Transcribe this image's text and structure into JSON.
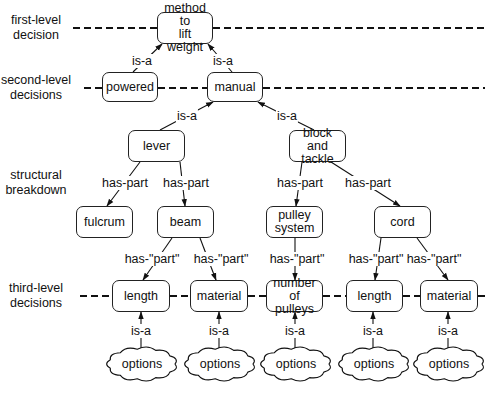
{
  "diagram": {
    "type": "decision hierarchy / part-whole tree",
    "side_labels": [
      {
        "id": "first",
        "text": "first-level\ndecision",
        "x": 36,
        "y": 28
      },
      {
        "id": "second",
        "text": "second-level\ndecisions",
        "x": 36,
        "y": 88
      },
      {
        "id": "structural",
        "text": "structural\nbreakdown",
        "x": 36,
        "y": 183
      },
      {
        "id": "third",
        "text": "third-level\ndecisions",
        "x": 36,
        "y": 296
      }
    ],
    "nodes": [
      {
        "id": "method",
        "text": "method to\nlift weight",
        "x": 157,
        "y": 12,
        "w": 56,
        "h": 32
      },
      {
        "id": "powered",
        "text": "powered",
        "x": 102,
        "y": 72,
        "w": 56,
        "h": 30
      },
      {
        "id": "manual",
        "text": "manual",
        "x": 207,
        "y": 72,
        "w": 56,
        "h": 30
      },
      {
        "id": "lever",
        "text": "lever",
        "x": 128,
        "y": 130,
        "w": 57,
        "h": 32
      },
      {
        "id": "block",
        "text": "block and\ntackle",
        "x": 289,
        "y": 130,
        "w": 57,
        "h": 32
      },
      {
        "id": "fulcrum",
        "text": "fulcrum",
        "x": 76,
        "y": 206,
        "w": 57,
        "h": 32
      },
      {
        "id": "beam",
        "text": "beam",
        "x": 157,
        "y": 206,
        "w": 57,
        "h": 32
      },
      {
        "id": "pulley",
        "text": "pulley\nsystem",
        "x": 266,
        "y": 206,
        "w": 57,
        "h": 32
      },
      {
        "id": "cord",
        "text": "cord",
        "x": 374,
        "y": 206,
        "w": 57,
        "h": 32
      },
      {
        "id": "length1",
        "text": "length",
        "x": 112,
        "y": 280,
        "w": 58,
        "h": 32
      },
      {
        "id": "material1",
        "text": "material",
        "x": 190,
        "y": 280,
        "w": 58,
        "h": 32
      },
      {
        "id": "numpulleys",
        "text": "number of\npulleys",
        "x": 266,
        "y": 280,
        "w": 57,
        "h": 32
      },
      {
        "id": "length2",
        "text": "length",
        "x": 346,
        "y": 280,
        "w": 57,
        "h": 32
      },
      {
        "id": "material2",
        "text": "material",
        "x": 420,
        "y": 280,
        "w": 58,
        "h": 32
      }
    ],
    "clouds": [
      {
        "id": "opt1",
        "text": "options",
        "cx": 142,
        "cy": 364
      },
      {
        "id": "opt2",
        "text": "options",
        "cx": 220,
        "cy": 364
      },
      {
        "id": "opt3",
        "text": "options",
        "cx": 296,
        "cy": 364
      },
      {
        "id": "opt4",
        "text": "options",
        "cx": 374,
        "cy": 364
      },
      {
        "id": "opt5",
        "text": "options",
        "cx": 449,
        "cy": 364
      }
    ],
    "edges": [
      {
        "from": "powered",
        "to": "method",
        "label": "is-a",
        "x1": 133,
        "y1": 72,
        "x2": 162,
        "y2": 44,
        "lx": 142,
        "ly": 61
      },
      {
        "from": "manual",
        "to": "method",
        "label": "is-a",
        "x1": 232,
        "y1": 72,
        "x2": 208,
        "y2": 44,
        "lx": 223,
        "ly": 61
      },
      {
        "from": "lever",
        "to": "manual",
        "label": "is-a",
        "x1": 160,
        "y1": 130,
        "x2": 213,
        "y2": 102,
        "lx": 187,
        "ly": 116
      },
      {
        "from": "block",
        "to": "manual",
        "label": "is-a",
        "x1": 314,
        "y1": 130,
        "x2": 258,
        "y2": 102,
        "lx": 287,
        "ly": 116
      },
      {
        "from": "lever",
        "to": "fulcrum",
        "label": "has-part",
        "x1": 140,
        "y1": 162,
        "x2": 107,
        "y2": 206,
        "lx": 125,
        "ly": 183
      },
      {
        "from": "lever",
        "to": "beam",
        "label": "has-part",
        "x1": 180,
        "y1": 162,
        "x2": 185,
        "y2": 206,
        "lx": 186,
        "ly": 183
      },
      {
        "from": "block",
        "to": "pulley",
        "label": "has-part",
        "x1": 302,
        "y1": 162,
        "x2": 296,
        "y2": 206,
        "lx": 300,
        "ly": 183
      },
      {
        "from": "block",
        "to": "cord",
        "label": "has-part",
        "x1": 331,
        "y1": 162,
        "x2": 400,
        "y2": 206,
        "lx": 368,
        "ly": 183
      },
      {
        "from": "beam",
        "to": "length1",
        "label": "has-\"part\"",
        "x1": 172,
        "y1": 238,
        "x2": 143,
        "y2": 280,
        "lx": 152,
        "ly": 259
      },
      {
        "from": "beam",
        "to": "material1",
        "label": "has-\"part\"",
        "x1": 200,
        "y1": 238,
        "x2": 216,
        "y2": 280,
        "lx": 221,
        "ly": 259
      },
      {
        "from": "pulley",
        "to": "numpulleys",
        "label": "has-\"part\"",
        "x1": 295,
        "y1": 238,
        "x2": 295,
        "y2": 280,
        "lx": 297,
        "ly": 259
      },
      {
        "from": "cord",
        "to": "length2",
        "label": "has-\"part\"",
        "x1": 381,
        "y1": 238,
        "x2": 375,
        "y2": 280,
        "lx": 376,
        "ly": 259
      },
      {
        "from": "cord",
        "to": "material2",
        "label": "has-\"part\"",
        "x1": 417,
        "y1": 238,
        "x2": 448,
        "y2": 280,
        "lx": 434,
        "ly": 259
      },
      {
        "from": "opt1",
        "to": "length1",
        "label": "is-a",
        "x1": 141,
        "y1": 350,
        "x2": 141,
        "y2": 312,
        "lx": 141,
        "ly": 331
      },
      {
        "from": "opt2",
        "to": "material1",
        "label": "is-a",
        "x1": 219,
        "y1": 350,
        "x2": 219,
        "y2": 312,
        "lx": 219,
        "ly": 331
      },
      {
        "from": "opt3",
        "to": "numpulleys",
        "label": "is-a",
        "x1": 295,
        "y1": 350,
        "x2": 295,
        "y2": 312,
        "lx": 295,
        "ly": 331
      },
      {
        "from": "opt4",
        "to": "length2",
        "label": "is-a",
        "x1": 373,
        "y1": 350,
        "x2": 373,
        "y2": 312,
        "lx": 373,
        "ly": 331
      },
      {
        "from": "opt5",
        "to": "material2",
        "label": "is-a",
        "x1": 448,
        "y1": 350,
        "x2": 448,
        "y2": 312,
        "lx": 448,
        "ly": 331
      }
    ],
    "dashed_levels": [
      {
        "y": 28,
        "segments": [
          [
            73,
            157
          ],
          [
            213,
            485
          ]
        ]
      },
      {
        "y": 88,
        "segments": [
          [
            84,
            102
          ],
          [
            158,
            207
          ],
          [
            263,
            485
          ]
        ]
      },
      {
        "y": 296,
        "segments": [
          [
            80,
            112
          ],
          [
            170,
            190
          ],
          [
            248,
            266
          ],
          [
            323,
            346
          ],
          [
            403,
            420
          ],
          [
            478,
            485
          ]
        ]
      }
    ]
  }
}
